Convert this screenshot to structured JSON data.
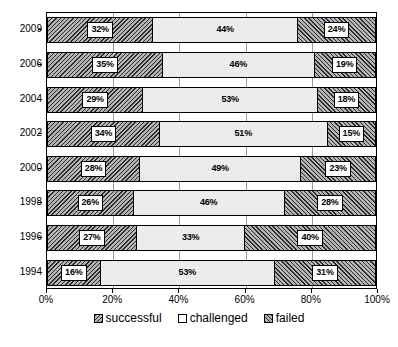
{
  "chart_data": {
    "type": "bar",
    "subtype": "stacked-horizontal-100pct",
    "title": "",
    "xlabel": "",
    "ylabel": "",
    "xlim": [
      0,
      100
    ],
    "xticks": [
      "0%",
      "20%",
      "40%",
      "60%",
      "80%",
      "100%"
    ],
    "xtick_values": [
      0,
      20,
      40,
      60,
      80,
      100
    ],
    "grid": true,
    "grid_axis": "x",
    "legend_position": "bottom",
    "categories": [
      "2009",
      "2006",
      "2004",
      "2002",
      "2000",
      "1998",
      "1996",
      "1994"
    ],
    "series": [
      {
        "name": "successful",
        "pattern": "diagonal-hatch-backslash",
        "values": [
          32,
          35,
          29,
          34,
          28,
          26,
          27,
          16
        ],
        "labels": [
          "32%",
          "35%",
          "29%",
          "34%",
          "28%",
          "26%",
          "27%",
          "16%"
        ]
      },
      {
        "name": "challenged",
        "pattern": "solid-light",
        "values": [
          44,
          46,
          53,
          51,
          49,
          46,
          33,
          53
        ],
        "labels": [
          "44%",
          "46%",
          "53%",
          "51%",
          "49%",
          "46%",
          "33%",
          "53%"
        ]
      },
      {
        "name": "failed",
        "pattern": "diagonal-hatch-forwardslash",
        "values": [
          24,
          19,
          18,
          15,
          23,
          28,
          40,
          31
        ],
        "labels": [
          "24%",
          "19%",
          "18%",
          "15%",
          "23%",
          "28%",
          "40%",
          "31%"
        ]
      }
    ]
  },
  "legend": {
    "items": [
      {
        "label": "successful",
        "key": "successful"
      },
      {
        "label": "challenged",
        "key": "challenged"
      },
      {
        "label": "failed",
        "key": "failed"
      }
    ]
  },
  "colors": {
    "hatch_ink": "#2b2b2b",
    "hatch_base": "#b4b4b4",
    "challenged_fill": "#ececec",
    "gridline": "#9a9a9a",
    "axis": "#000000",
    "background": "#ffffff"
  }
}
